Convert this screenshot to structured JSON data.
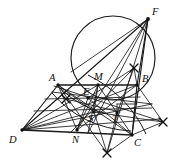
{
  "figure": {
    "canvas": {
      "width": 183,
      "height": 164
    },
    "background_color": "#ffffff",
    "ink_color": "#1a1a1a",
    "points": [
      {
        "id": "A",
        "label": "A",
        "x": 58,
        "y": 85,
        "label_x": 49,
        "label_y": 81
      },
      {
        "id": "B",
        "label": "B",
        "x": 137,
        "y": 85,
        "label_x": 142,
        "label_y": 82
      },
      {
        "id": "C",
        "label": "C",
        "x": 132,
        "y": 135,
        "label_x": 134,
        "label_y": 146
      },
      {
        "id": "D",
        "label": "D",
        "x": 22,
        "y": 130,
        "label_x": 9,
        "label_y": 143
      },
      {
        "id": "E",
        "label": "E",
        "x": 88,
        "y": 98,
        "label_x": 83,
        "label_y": 95
      },
      {
        "id": "F",
        "label": "F",
        "x": 148,
        "y": 19,
        "label_x": 152,
        "label_y": 15
      },
      {
        "id": "M",
        "label": "M",
        "x": 98,
        "y": 85,
        "label_x": 95,
        "label_y": 80
      },
      {
        "id": "N",
        "label": "N",
        "x": 77,
        "y": 130,
        "label_x": 73,
        "label_y": 143
      },
      {
        "id": "S",
        "label": "S",
        "x": 94,
        "y": 112,
        "label_x": 88,
        "label_y": 122
      },
      {
        "id": "T",
        "label": "T",
        "x": 117,
        "y": 113,
        "label_x": 113,
        "label_y": 122
      }
    ],
    "circle": {
      "cx": 113,
      "cy": 58,
      "r": 42
    },
    "arc_marks": [
      {
        "id": "mark-upper",
        "x": 134,
        "y": 68
      },
      {
        "id": "mark-right",
        "x": 163,
        "y": 122
      },
      {
        "id": "mark-lower",
        "x": 107,
        "y": 153
      },
      {
        "id": "mark-left",
        "x": 66,
        "y": 99
      }
    ],
    "segments": [
      {
        "id": "AB",
        "from": "A",
        "to": "B"
      },
      {
        "id": "DC",
        "from": "D",
        "to": "C"
      },
      {
        "id": "DA",
        "from": "D",
        "to": "A"
      },
      {
        "id": "BC",
        "from": "B",
        "to": "C"
      },
      {
        "id": "AC",
        "from": "A",
        "to": "C"
      },
      {
        "id": "DB",
        "from": "D",
        "to": "B"
      },
      {
        "id": "DF",
        "from": "D",
        "to": "F"
      },
      {
        "id": "FB",
        "from": "F",
        "to": "B"
      },
      {
        "id": "FC",
        "from": "F",
        "to": "C"
      },
      {
        "id": "FN",
        "from": "F",
        "to": "N"
      },
      {
        "id": "FS",
        "from": "F",
        "to": "S"
      },
      {
        "id": "FT",
        "from": "F",
        "to": "T"
      },
      {
        "id": "FD-chord",
        "from": "F",
        "to": "E"
      },
      {
        "id": "AN",
        "from": "A",
        "to": "N"
      },
      {
        "id": "MN",
        "from": "M",
        "to": "N"
      },
      {
        "id": "MC",
        "from": "M",
        "to": "C"
      },
      {
        "id": "MS",
        "from": "M",
        "to": "S"
      },
      {
        "id": "AT",
        "from": "A",
        "to": "T"
      },
      {
        "id": "NB",
        "from": "N",
        "to": "B"
      },
      {
        "id": "ST",
        "from": "S",
        "to": "T"
      },
      {
        "id": "DT",
        "from": "D",
        "to": "T"
      },
      {
        "id": "DS",
        "from": "D",
        "to": "S"
      },
      {
        "id": "DE",
        "from": "D",
        "to": "E"
      },
      {
        "id": "DM",
        "from": "D",
        "to": "M"
      }
    ]
  }
}
